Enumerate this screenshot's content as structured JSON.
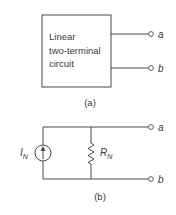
{
  "figure_a": {
    "box_label_lines": [
      "Linear",
      "two-terminal",
      "circuit"
    ],
    "terminal_top": "a",
    "terminal_bottom": "b",
    "caption": "(a)"
  },
  "figure_b": {
    "source_label": "I",
    "source_subscript": "N",
    "resistor_label": "R",
    "resistor_subscript": "N",
    "terminal_top": "a",
    "terminal_bottom": "b",
    "caption": "(b)"
  },
  "colors": {
    "line": "#4a4a4a",
    "text": "#3a3a3a",
    "background": "#ffffff"
  }
}
